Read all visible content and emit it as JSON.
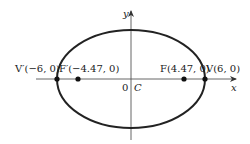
{
  "diagram": {
    "axes": {
      "x_label": "x",
      "y_label": "y"
    },
    "origin": {
      "zero_label": "0",
      "center_label": "C"
    },
    "points": [
      {
        "name": "V'",
        "label": "V′(−6, 0)",
        "x": -6,
        "y": 0,
        "kind": "vertex"
      },
      {
        "name": "F'",
        "label": "F′(−4.47, 0)",
        "x": -4.47,
        "y": 0,
        "kind": "focus"
      },
      {
        "name": "F",
        "label": "F(4.47, 0)",
        "x": 4.47,
        "y": 0,
        "kind": "focus"
      },
      {
        "name": "V",
        "label": "V(6, 0)",
        "x": 6,
        "y": 0,
        "kind": "vertex"
      }
    ],
    "colors": {
      "stroke": "#222222",
      "axis": "#555555",
      "background": "#ffffff"
    }
  }
}
